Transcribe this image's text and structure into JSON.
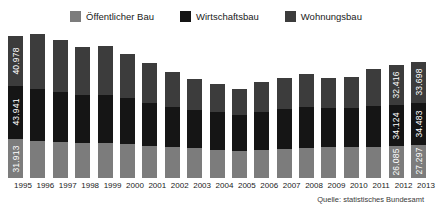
{
  "legend": {
    "items": [
      {
        "label": "Öffentlicher Bau",
        "color": "#7c7c7c",
        "icon": "legend-swatch-icon"
      },
      {
        "label": "Wirtschaftsbau",
        "color": "#151515",
        "icon": "legend-swatch-icon"
      },
      {
        "label": "Wohnungsbau",
        "color": "#3c3c3c",
        "icon": "legend-swatch-icon"
      }
    ]
  },
  "source": {
    "text": "Quelle: statistisches Bundesamt"
  },
  "chart_data": {
    "type": "bar",
    "stacked": true,
    "title": "",
    "xlabel": "",
    "ylabel": "",
    "grid": false,
    "legend_position": "top-center",
    "ylim": [
      0,
      125000
    ],
    "categories": [
      "1995",
      "1996",
      "1997",
      "1998",
      "1999",
      "2000",
      "2001",
      "2002",
      "2003",
      "2004",
      "2005",
      "2006",
      "2007",
      "2008",
      "2009",
      "2010",
      "2011",
      "2012",
      "2013"
    ],
    "series": [
      {
        "name": "Öffentlicher Bau",
        "color": "#7c7c7c",
        "values": [
          31913,
          30800,
          29500,
          28600,
          28900,
          27600,
          26400,
          25200,
          24300,
          23400,
          22600,
          23400,
          24100,
          24900,
          25400,
          25100,
          25600,
          26085,
          27297
        ],
        "labels": {
          "1995": "31.913",
          "2012": "26.085",
          "2013": "27.297"
        }
      },
      {
        "name": "Wirtschaftsbau",
        "color": "#151515",
        "values": [
          43941,
          42800,
          41200,
          39800,
          39600,
          38200,
          35600,
          33200,
          31800,
          30600,
          29400,
          31200,
          32600,
          33800,
          32400,
          32800,
          33600,
          34124,
          34483
        ],
        "labels": {
          "1995": "43.941",
          "2012": "34.124",
          "2013": "34.483"
        }
      },
      {
        "name": "Wohnungsbau",
        "color": "#3c3c3c",
        "values": [
          40978,
          44600,
          42900,
          39600,
          39900,
          36400,
          32600,
          28400,
          25600,
          23200,
          21400,
          24600,
          25400,
          26600,
          24600,
          24800,
          30600,
          32416,
          33698
        ],
        "labels": {
          "1995": "40.978",
          "2012": "32.416",
          "2013": "33.698"
        }
      }
    ],
    "totals": [
      116832,
      118200,
      113600,
      108000,
      108400,
      102200,
      94600,
      86800,
      81700,
      77200,
      73400,
      79200,
      82100,
      85300,
      82400,
      82700,
      89800,
      92625,
      95478
    ]
  }
}
